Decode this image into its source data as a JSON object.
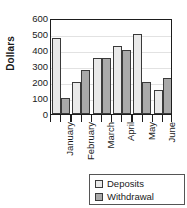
{
  "crop_title": "Withdrawals",
  "chart_data": {
    "type": "bar",
    "title": "",
    "xlabel": "",
    "ylabel": "Dollars",
    "ylim": [
      0,
      600
    ],
    "yticks": [
      0,
      100,
      200,
      300,
      400,
      500,
      600
    ],
    "ytick_labels": [
      "0",
      "100",
      "200",
      "300",
      "400",
      "500",
      "600"
    ],
    "grid": true,
    "legend_position": "bottom-right",
    "categories": [
      "January",
      "February",
      "March",
      "April",
      "May",
      "June"
    ],
    "series": [
      {
        "name": "Deposits",
        "color": "#e9e9e9",
        "values": [
          475,
          200,
          350,
          425,
          500,
          150
        ]
      },
      {
        "name": "Withdrawal",
        "color": "#a9a9a9",
        "values": [
          100,
          275,
          350,
          400,
          200,
          225
        ]
      }
    ]
  },
  "legend": {
    "items": [
      {
        "label": "Deposits"
      },
      {
        "label": "Withdrawal"
      }
    ]
  },
  "colors": {
    "deposits": "#e9e9e9",
    "withdrawal": "#a9a9a9",
    "axis": "#1d1d1d",
    "grid": "#e2e2e2"
  }
}
